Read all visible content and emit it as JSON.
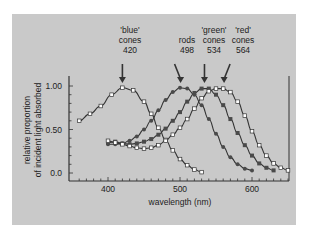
{
  "chart_data": {
    "type": "line",
    "title": "",
    "xlabel": "wavelength (nm)",
    "ylabel": "relative proportion of incident light absorbed",
    "xlim": [
      360,
      650
    ],
    "ylim": [
      0.0,
      1.1
    ],
    "x_ticks": [
      400,
      500,
      600
    ],
    "y_ticks": [
      "0.0",
      "0.50",
      "1.00"
    ],
    "grid": false,
    "legend": "none; series labelled by annotations with arrows above peaks",
    "annotations": [
      {
        "line1": "'blue'",
        "line2": "cones",
        "line3": "420",
        "peak_x": 420
      },
      {
        "line1": "",
        "line2": "rods",
        "line3": "498",
        "peak_x": 498
      },
      {
        "line1": "'green'",
        "line2": "cones",
        "line3": "534",
        "peak_x": 534
      },
      {
        "line1": "'red'",
        "line2": "cones",
        "line3": "564",
        "peak_x": 564
      }
    ],
    "series": [
      {
        "name": "'blue' cones",
        "peak": 420,
        "marker": "open-square",
        "x": [
          360,
          375,
          390,
          405,
          420,
          435,
          450,
          460,
          470,
          480,
          490,
          500,
          510,
          520,
          530
        ],
        "y": [
          0.6,
          0.68,
          0.77,
          0.9,
          0.98,
          0.95,
          0.82,
          0.68,
          0.52,
          0.38,
          0.26,
          0.16,
          0.09,
          0.04,
          0.01
        ]
      },
      {
        "name": "rods",
        "peak": 498,
        "marker": "filled-circle",
        "x": [
          400,
          410,
          420,
          430,
          440,
          450,
          460,
          470,
          480,
          490,
          500,
          510,
          520,
          530,
          540,
          550,
          560,
          570,
          580,
          590,
          600
        ],
        "y": [
          0.33,
          0.33,
          0.34,
          0.37,
          0.42,
          0.5,
          0.6,
          0.72,
          0.84,
          0.93,
          0.98,
          0.97,
          0.9,
          0.78,
          0.62,
          0.45,
          0.3,
          0.18,
          0.1,
          0.05,
          0.03
        ]
      },
      {
        "name": "'green' cones",
        "peak": 534,
        "marker": "filled-square",
        "x": [
          400,
          410,
          420,
          430,
          440,
          450,
          460,
          470,
          480,
          490,
          500,
          510,
          520,
          530,
          540,
          550,
          560,
          570,
          580,
          590,
          600,
          610,
          620,
          630
        ],
        "y": [
          0.35,
          0.36,
          0.34,
          0.33,
          0.34,
          0.36,
          0.39,
          0.44,
          0.51,
          0.6,
          0.7,
          0.82,
          0.92,
          0.97,
          0.97,
          0.9,
          0.78,
          0.62,
          0.46,
          0.32,
          0.2,
          0.11,
          0.06,
          0.03
        ]
      },
      {
        "name": "'red' cones",
        "peak": 564,
        "marker": "open-square",
        "x": [
          400,
          410,
          420,
          430,
          440,
          450,
          460,
          470,
          480,
          490,
          500,
          510,
          520,
          530,
          540,
          550,
          560,
          570,
          580,
          590,
          600,
          610,
          620,
          630,
          640,
          650
        ],
        "y": [
          0.37,
          0.35,
          0.33,
          0.31,
          0.29,
          0.28,
          0.29,
          0.32,
          0.37,
          0.44,
          0.52,
          0.62,
          0.74,
          0.86,
          0.94,
          0.97,
          0.97,
          0.93,
          0.82,
          0.66,
          0.48,
          0.32,
          0.2,
          0.11,
          0.06,
          0.03
        ]
      }
    ],
    "colors": {
      "panel_bg": "#c9c9c9",
      "line": "#333333",
      "filled_marker": "#4a4a4a",
      "open_marker": "#ffffff"
    }
  }
}
